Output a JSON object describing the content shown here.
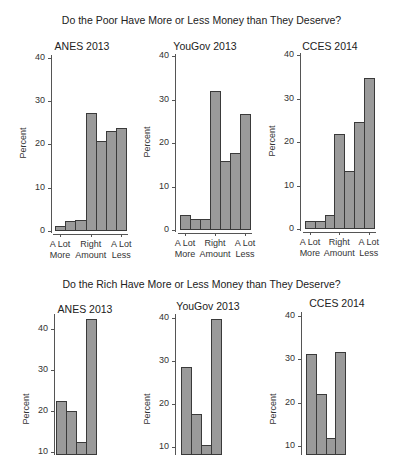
{
  "chart_data": [
    {
      "type": "bar",
      "group_title": "Do the Poor Have More or Less Money than They Deserve?",
      "title": "ANES 2013",
      "xlabel": "",
      "ylabel": "Percent",
      "ylim": [
        0,
        40
      ],
      "yticks": [
        0,
        10,
        20,
        30,
        40
      ],
      "categories": [
        "A Lot More",
        "2",
        "3",
        "Right Amount",
        "5",
        "6",
        "A Lot Less"
      ],
      "x_tick_labels": [
        "A Lot More",
        "Right Amount",
        "A Lot Less"
      ],
      "values": [
        1.2,
        2.2,
        2.5,
        27.3,
        20.8,
        23.0,
        23.9
      ]
    },
    {
      "type": "bar",
      "group_title": "Do the Poor Have More or Less Money than They Deserve?",
      "title": "YouGov 2013",
      "xlabel": "",
      "ylabel": "Percent",
      "ylim": [
        0,
        40
      ],
      "yticks": [
        0,
        10,
        20,
        30,
        40
      ],
      "categories": [
        "A Lot More",
        "2",
        "3",
        "Right Amount",
        "5",
        "6",
        "A Lot Less"
      ],
      "x_tick_labels": [
        "A Lot More",
        "Right Amount",
        "A Lot Less"
      ],
      "values": [
        3.5,
        2.6,
        2.6,
        32.0,
        15.8,
        17.8,
        26.7
      ]
    },
    {
      "type": "bar",
      "group_title": "Do the Poor Have More or Less Money than They Deserve?",
      "title": "CCES 2014",
      "xlabel": "",
      "ylabel": "Percent",
      "ylim": [
        0,
        40
      ],
      "yticks": [
        0,
        10,
        20,
        30,
        40
      ],
      "categories": [
        "A Lot More",
        "2",
        "3",
        "Right Amount",
        "5",
        "6",
        "A Lot Less"
      ],
      "x_tick_labels": [
        "A Lot More",
        "Right Amount",
        "A Lot Less"
      ],
      "values": [
        1.8,
        1.8,
        3.3,
        21.9,
        13.3,
        24.7,
        34.6
      ]
    },
    {
      "type": "bar",
      "group_title": "Do the Rich Have More or Less Money than They Deserve?",
      "title": "ANES 2013",
      "xlabel": "",
      "ylabel": "Percent",
      "ylim": [
        10,
        40
      ],
      "yticks": [
        10,
        20,
        30,
        40
      ],
      "categories": [
        "1",
        "2",
        "3",
        "4"
      ],
      "values": [
        22.5,
        20.0,
        12.4,
        42.5
      ],
      "note": "only the first four bars are visible; chart is cropped at the bottom"
    },
    {
      "type": "bar",
      "group_title": "Do the Rich Have More or Less Money than They Deserve?",
      "title": "YouGov 2013",
      "xlabel": "",
      "ylabel": "Percent",
      "ylim": [
        10,
        40
      ],
      "yticks": [
        10,
        20,
        30,
        40
      ],
      "categories": [
        "1",
        "2",
        "3",
        "4"
      ],
      "values": [
        28.5,
        17.7,
        10.5,
        39.7
      ],
      "note": "only the first four bars are visible; chart is cropped at the bottom"
    },
    {
      "type": "bar",
      "group_title": "Do the Rich Have More or Less Money than They Deserve?",
      "title": "CCES 2014",
      "xlabel": "",
      "ylabel": "Percent",
      "ylim": [
        10,
        40
      ],
      "yticks": [
        10,
        20,
        30,
        40
      ],
      "categories": [
        "1",
        "2",
        "3",
        "4"
      ],
      "values": [
        31.2,
        22.0,
        11.8,
        31.8
      ],
      "note": "only the first four bars are visible; chart is cropped at the bottom"
    }
  ],
  "sections": {
    "top_title": "Do the Poor Have More or Less Money than They Deserve?",
    "bottom_title": "Do the Rich Have More or Less Money than They Deserve?"
  },
  "panels": [
    {
      "title": "ANES 2013",
      "ylabel": "Percent"
    },
    {
      "title": "YouGov 2013",
      "ylabel": "Percent"
    },
    {
      "title": "CCES 2014",
      "ylabel": "Percent"
    },
    {
      "title": "ANES 2013",
      "ylabel": "Percent"
    },
    {
      "title": "YouGov 2013",
      "ylabel": "Percent"
    },
    {
      "title": "CCES 2014",
      "ylabel": "Percent"
    }
  ],
  "xlabels": {
    "left": [
      "A Lot",
      "More"
    ],
    "mid": [
      "Right",
      "Amount"
    ],
    "right": [
      "A Lot",
      "Less"
    ]
  },
  "colors": {
    "bar_fill": "#9a9a9a",
    "bar_edge": "#3a3a3a",
    "axis": "#555555",
    "background": "#ffffff"
  }
}
